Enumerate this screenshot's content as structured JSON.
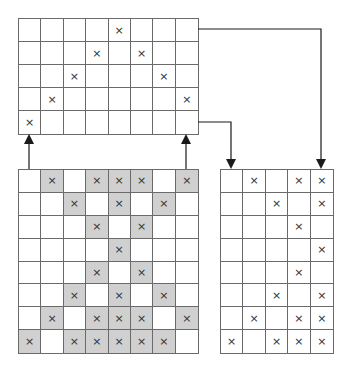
{
  "mark_glyph": "×",
  "colors": {
    "line": "#6a6a6a",
    "shade": "#d0d0d0",
    "arrow": "#1a1a1a"
  },
  "grids": {
    "top": {
      "x": 18,
      "y": 18,
      "cols": 8,
      "rows": 5,
      "cellW": 22.5,
      "cellH": 23.2,
      "marks": [
        [
          4
        ],
        [
          3,
          5
        ],
        [
          2,
          6
        ],
        [
          1,
          7
        ],
        [
          0
        ]
      ],
      "shaded": [
        [],
        [],
        [],
        [],
        []
      ]
    },
    "bottom_left": {
      "x": 18,
      "y": 169,
      "cols": 8,
      "rows": 8,
      "cellW": 22.5,
      "cellH": 23,
      "marks": [
        [
          1,
          3,
          4,
          5,
          7
        ],
        [
          2,
          4,
          6
        ],
        [
          3,
          5
        ],
        [
          4
        ],
        [
          3,
          5
        ],
        [
          2,
          4,
          6
        ],
        [
          1,
          3,
          4,
          5,
          7
        ],
        [
          0,
          2,
          3,
          4,
          5,
          6
        ]
      ],
      "shaded": [
        [
          1,
          3,
          4,
          5,
          7
        ],
        [
          2,
          4,
          6
        ],
        [
          3,
          5
        ],
        [
          4
        ],
        [
          3,
          5
        ],
        [
          2,
          4,
          6
        ],
        [
          1,
          3,
          4,
          5,
          7
        ],
        [
          0,
          2,
          3,
          4,
          5,
          6
        ]
      ]
    },
    "right": {
      "x": 220,
      "y": 169,
      "cols": 5,
      "rows": 8,
      "cellW": 22.6,
      "cellH": 23,
      "marks": [
        [
          1,
          3,
          4
        ],
        [
          2,
          4
        ],
        [
          3
        ],
        [
          4
        ],
        [
          3
        ],
        [
          2,
          4
        ],
        [
          1,
          3,
          4
        ],
        [
          0,
          2,
          3,
          4
        ]
      ],
      "shaded": [
        [],
        [],
        [],
        [],
        [],
        [],
        [],
        []
      ]
    }
  },
  "arrows": [
    {
      "name": "arrow-bottom-to-top-left",
      "points": [
        [
          29,
          169
        ],
        [
          29,
          136
        ]
      ]
    },
    {
      "name": "arrow-bottom-to-top-right",
      "points": [
        [
          186,
          169
        ],
        [
          186,
          136
        ]
      ]
    },
    {
      "name": "arrow-top-row0-to-right-col4",
      "points": [
        [
          198,
          29
        ],
        [
          321,
          29
        ],
        [
          321,
          167
        ]
      ]
    },
    {
      "name": "arrow-top-row4-to-right-col0",
      "points": [
        [
          198,
          122
        ],
        [
          231,
          122
        ],
        [
          231,
          167
        ]
      ]
    }
  ]
}
